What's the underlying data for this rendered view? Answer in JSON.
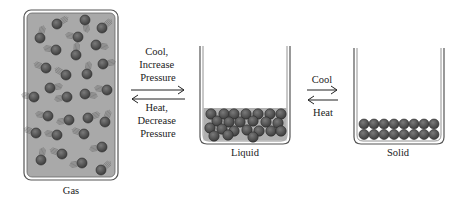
{
  "diagram": {
    "states": [
      {
        "id": "gas",
        "label": "Gas"
      },
      {
        "id": "liquid",
        "label": "Liquid"
      },
      {
        "id": "solid",
        "label": "Solid"
      }
    ],
    "transitions": [
      {
        "from": "gas",
        "to": "liquid",
        "forward_label": [
          "Cool,",
          "Increase",
          "Pressure"
        ],
        "reverse_label": [
          "Heat,",
          "Decrease",
          "Pressure"
        ]
      },
      {
        "from": "liquid",
        "to": "solid",
        "forward_label": [
          "Cool"
        ],
        "reverse_label": [
          "Heat"
        ]
      }
    ],
    "colors": {
      "particle": "#5a5a5a",
      "particle_stroke": "#2a2a2a",
      "medium": "#a8a8a8",
      "container": "#555555",
      "background": "#ffffff"
    }
  }
}
